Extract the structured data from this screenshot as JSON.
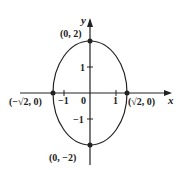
{
  "diagram": {
    "type": "ellipse-graph",
    "equation_description": "Ellipse centered at origin with semi-axis sqrt(2) along x and 2 along y",
    "axes": {
      "x_label": "x",
      "y_label": "y"
    },
    "ticks": {
      "x": [
        {
          "value": -1,
          "label": "−1"
        },
        {
          "value": 0,
          "label": "0"
        },
        {
          "value": 1,
          "label": "1"
        }
      ],
      "y": [
        {
          "value": 1,
          "label": "1"
        },
        {
          "value": -1,
          "label": "−1"
        }
      ]
    },
    "points": [
      {
        "name": "top-vertex",
        "label": "(0, 2)",
        "x": 0,
        "y": 2
      },
      {
        "name": "bottom-vertex",
        "label": "(0, −2)",
        "x": 0,
        "y": -2
      },
      {
        "name": "left-vertex",
        "label": "(−√2, 0)",
        "x": -1.414,
        "y": 0
      },
      {
        "name": "right-vertex",
        "label": "(√2, 0)",
        "x": 1.414,
        "y": 0
      }
    ],
    "colors": {
      "stroke": "#222222",
      "background": "#ffffff"
    }
  }
}
